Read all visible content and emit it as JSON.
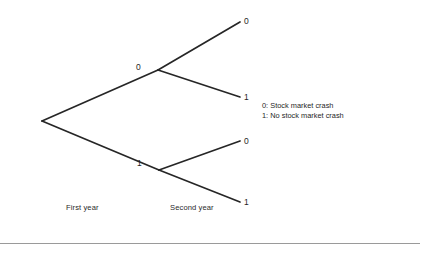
{
  "figure": {
    "type": "probability-tree",
    "background_color": "#ffffff",
    "line_color": "#262626",
    "text_color": "#1f1f1f",
    "rule_color": "#9a9a9a"
  },
  "tree": {
    "root": {
      "x": 42,
      "y": 121
    },
    "nodes": [
      {
        "id": "first-year-0",
        "label": "0",
        "x": 158,
        "y": 70,
        "label_x": 136,
        "label_y": 63
      },
      {
        "id": "first-year-1",
        "label": "1",
        "x": 159,
        "y": 170,
        "label_x": 137,
        "label_y": 159
      }
    ],
    "leaves": [
      {
        "id": "leaf-00",
        "label": "0",
        "x": 240,
        "y": 22,
        "label_x": 244,
        "label_y": 17
      },
      {
        "id": "leaf-01",
        "label": "1",
        "x": 240,
        "y": 97,
        "label_x": 244,
        "label_y": 93
      },
      {
        "id": "leaf-10",
        "label": "0",
        "x": 240,
        "y": 141,
        "label_x": 244,
        "label_y": 137
      },
      {
        "id": "leaf-11",
        "label": "1",
        "x": 240,
        "y": 202,
        "label_x": 244,
        "label_y": 198
      }
    ]
  },
  "stage_labels": [
    {
      "id": "stage-first-year",
      "text": "First year",
      "x": 66,
      "y": 203
    },
    {
      "id": "stage-second-year",
      "text": "Second year",
      "x": 170,
      "y": 203
    }
  ],
  "legend": {
    "lines": [
      "0: Stock market crash",
      "1: No stock market crash"
    ]
  },
  "footer_rule": {
    "x1": 0,
    "y1": 243.5,
    "x2": 420,
    "y2": 243.5
  }
}
